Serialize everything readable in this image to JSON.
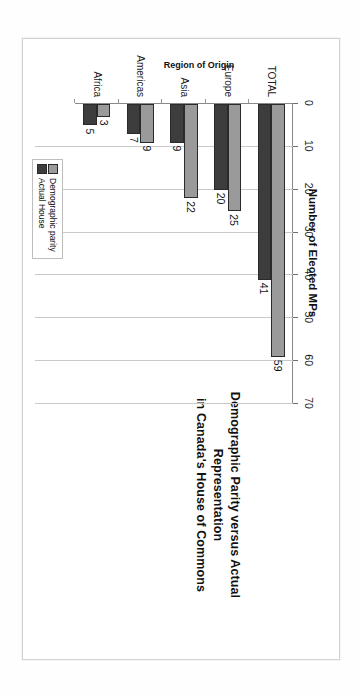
{
  "chart_data": {
    "type": "bar",
    "orientation": "horizontal",
    "title": "Demographic Parity versus Actual Representation in Canada's House of Commons",
    "title_lines": [
      "Demographic Parity versus Actual Representation",
      "in Canada's House of Commons"
    ],
    "xlabel": "Number of Elected MPs",
    "ylabel": "Region of Origin",
    "categories": [
      "TOTAL",
      "Europe",
      "Asia",
      "Americas",
      "Africa"
    ],
    "series": [
      {
        "name": "Demographic parity",
        "color": "#9a9a9a",
        "values": [
          59,
          25,
          22,
          9,
          3
        ]
      },
      {
        "name": "Actual House",
        "color": "#3d3d3d",
        "values": [
          41,
          20,
          9,
          7,
          5
        ]
      }
    ],
    "xlim": [
      0,
      70
    ],
    "xticks": [
      0,
      10,
      20,
      30,
      40,
      50,
      60,
      70
    ],
    "xticklabels": [
      "0",
      "10",
      "20",
      "30",
      "40",
      "50",
      "60",
      "70"
    ],
    "grid": true,
    "data_labels": true,
    "legend_position": "bottom-center",
    "page_rotation_degrees": 90
  },
  "legend": {
    "entries": [
      {
        "label": "Demographic parity"
      },
      {
        "label": "Actual House"
      }
    ]
  },
  "axis": {
    "x_title": "Number of Elected MPs",
    "y_title": "Region of Origin"
  }
}
